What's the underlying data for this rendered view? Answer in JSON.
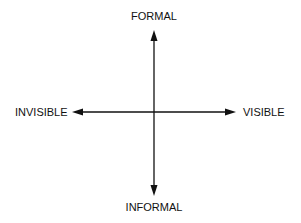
{
  "diagram": {
    "type": "quadrant-axes",
    "axes": {
      "vertical": {
        "top_label": "FORMAL",
        "bottom_label": "INFORMAL"
      },
      "horizontal": {
        "left_label": "INVISIBLE",
        "right_label": "VISIBLE"
      }
    },
    "colors": {
      "line": "#111111",
      "text": "#111111",
      "background": "#ffffff"
    }
  }
}
